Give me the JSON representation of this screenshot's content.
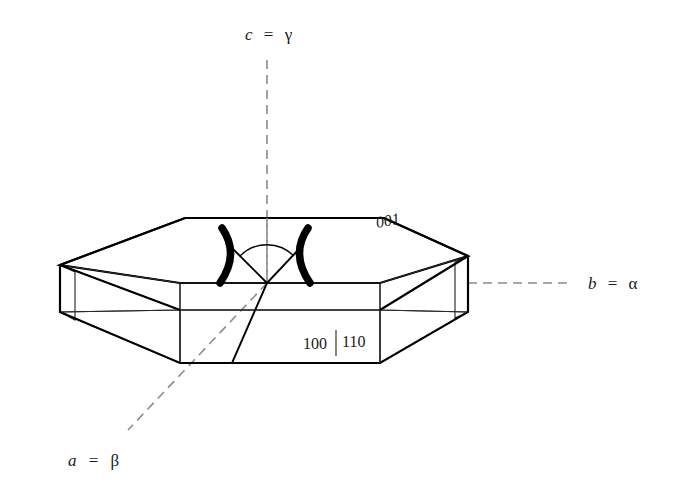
{
  "figure": {
    "background_color": "#ffffff",
    "line_color": "#000000",
    "dash_axis_color": "#8a8a8a",
    "side_face_fill": "#e9e9e9",
    "top_face_fill": "#ffffff",
    "end_face_fill": "#ffffff"
  },
  "axes": [
    {
      "id": "c-axis",
      "label_full": "c = γ",
      "italic_part": "c",
      "equals": "=",
      "greek_part": "γ",
      "orientation": "vertical",
      "label_x": 268,
      "label_y": 40
    },
    {
      "id": "b-axis",
      "label_full": "b = α",
      "italic_part": "b",
      "equals": "=",
      "greek_part": "α",
      "orientation": "horizontal-right",
      "label_x": 596,
      "label_y": 288
    },
    {
      "id": "a-axis",
      "label_full": "a = β",
      "italic_part": "a",
      "equals": "=",
      "greek_part": "β",
      "orientation": "diagonal-lower-left",
      "label_x": 74,
      "label_y": 464
    }
  ],
  "face_labels": [
    {
      "id": "face-001",
      "text": "001",
      "style": "italic",
      "x": 377,
      "y": 228
    },
    {
      "id": "face-100",
      "text": "100",
      "style": "roman",
      "x": 303,
      "y": 349
    },
    {
      "id": "face-110",
      "text": "110",
      "style": "roman",
      "x": 342,
      "y": 347
    }
  ],
  "optic_marks": {
    "left_arc_label": "optic-axis-arc-left",
    "right_arc_label": "optic-axis-arc-right",
    "angle_arc_label": "optic-angle-arc"
  }
}
